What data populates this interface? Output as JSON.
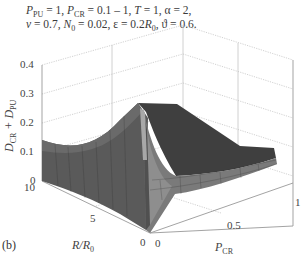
{
  "chart_data": {
    "type": "surface3d",
    "panel_label": "(b)",
    "annotation_line1": "P_PU = 1, P_CR = 0.1 – 1, T = 1, α = 2,",
    "annotation_line2": "ν = 0.7, N_0 = 0.02, ε = 0.2R_0, ϑ = 0.6,",
    "parameters": {
      "P_PU": 1,
      "P_CR": "0.1 – 1",
      "T": 1,
      "alpha": 2,
      "nu": 0.7,
      "N_0": 0.02,
      "epsilon": "0.2R_0",
      "theta": 0.6
    },
    "zlabel": "D_CR + D_PU",
    "xlabel": "P_CR",
    "ylabel": "R/R_0",
    "zlim": [
      0,
      0.4
    ],
    "xlim": [
      0,
      1
    ],
    "ylim": [
      0,
      10
    ],
    "zticks": [
      "0",
      "0.1",
      "0.2",
      "0.3",
      "0.4"
    ],
    "xticks": [
      "0",
      "0.5",
      "1"
    ],
    "yticks": [
      "0",
      "5",
      "10"
    ],
    "grid": true,
    "colormap": "grayscale",
    "approx_points": [
      {
        "R_over_R0": 10,
        "P_CR": 0,
        "value": 0.08
      },
      {
        "R_over_R0": 5,
        "P_CR": 0,
        "value": 0.05
      },
      {
        "R_over_R0": 1,
        "P_CR": 0.1,
        "value": 0.3
      },
      {
        "R_over_R0": 0,
        "P_CR": 0.1,
        "value": 0.0
      },
      {
        "R_over_R0": 1,
        "P_CR": 1,
        "value": 0.12
      }
    ]
  },
  "labels": {
    "z_axis": "D",
    "z_sub1": "CR",
    "z_plus": " + D",
    "z_sub2": "PU",
    "x_axis": "P",
    "x_sub": "CR",
    "y_axis": "R/R",
    "y_sub": "0",
    "panel": "(b)"
  },
  "params": {
    "l1": [
      {
        "t": "P",
        "i": true
      },
      {
        "t": "PU",
        "s": true
      },
      {
        "t": " = 1, "
      },
      {
        "t": "P",
        "i": true
      },
      {
        "t": "CR",
        "s": true
      },
      {
        "t": " = 0.1 – 1, "
      },
      {
        "t": "T",
        "i": true
      },
      {
        "t": " = 1, α = 2,"
      }
    ],
    "l2": [
      {
        "t": "ν",
        "i": true
      },
      {
        "t": " = 0.7, "
      },
      {
        "t": "N",
        "i": true
      },
      {
        "t": "0",
        "s": true
      },
      {
        "t": " = 0.02, ε = 0.2"
      },
      {
        "t": "R",
        "i": true
      },
      {
        "t": "0",
        "s": true
      },
      {
        "t": ", ϑ = 0.6."
      }
    ]
  },
  "ticks": {
    "z": [
      {
        "v": "0.4",
        "y": 58
      },
      {
        "v": "0.3",
        "y": 87
      },
      {
        "v": "0.2",
        "y": 116
      },
      {
        "v": "0.1",
        "y": 145
      },
      {
        "v": "0",
        "y": 174
      }
    ],
    "y": [
      {
        "v": "10",
        "x": 24,
        "y": 181
      },
      {
        "v": "5",
        "x": 90,
        "y": 212
      },
      {
        "v": "0",
        "x": 140,
        "y": 236
      }
    ],
    "x": [
      {
        "v": "0",
        "x": 155,
        "y": 237
      },
      {
        "v": "0.5",
        "x": 227,
        "y": 219
      },
      {
        "v": "1",
        "x": 295,
        "y": 196
      }
    ]
  },
  "colors": {
    "grid": "#b8b8b8",
    "axis": "#9a9a9a",
    "surface_dark": "#4a4a4a",
    "surface_mid": "#6e6e6e",
    "surface_light": "#9a9a9a"
  }
}
